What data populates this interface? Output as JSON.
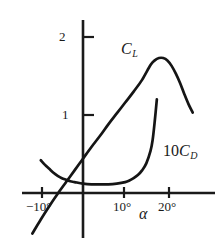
{
  "chart_data": {
    "type": "line",
    "title": "",
    "subtitle": "",
    "xlabel": "α",
    "ylabel": "",
    "xlim": [
      -13,
      31
    ],
    "ylim": [
      -0.7,
      2.25
    ],
    "grid": false,
    "legend": "inline-curve-labels",
    "x_ticks": [
      -10,
      10,
      20
    ],
    "x_tick_labels": [
      "−10°",
      "10°",
      "20°"
    ],
    "y_ticks": [
      1,
      2
    ],
    "y_tick_labels": [
      "1",
      "2"
    ],
    "x_unit": "degrees",
    "series": [
      {
        "name": "C_L",
        "label_text": "C",
        "label_sub": "L",
        "x": [
          -12.0,
          -10.0,
          -8.0,
          -6.0,
          -4.0,
          -2.0,
          0.0,
          2.0,
          4.0,
          6.0,
          8.0,
          10.0,
          12.0,
          14.0,
          16.0,
          17.0,
          18.0,
          19.0,
          20.0,
          21.0,
          22.0,
          23.0,
          24.0,
          25.0,
          26.0
        ],
        "y": [
          -0.52,
          -0.34,
          -0.17,
          -0.01,
          0.14,
          0.29,
          0.44,
          0.59,
          0.73,
          0.88,
          1.02,
          1.16,
          1.3,
          1.45,
          1.64,
          1.7,
          1.73,
          1.73,
          1.7,
          1.63,
          1.53,
          1.41,
          1.27,
          1.14,
          1.03
        ]
      },
      {
        "name": "10C_D",
        "label_text": "C",
        "label_sub": "D",
        "label_prefix": "10",
        "x": [
          -10.0,
          -9.0,
          -8.0,
          -7.0,
          -6.0,
          -5.0,
          -4.0,
          -3.0,
          -2.0,
          0.0,
          2.0,
          4.0,
          6.0,
          8.0,
          10.0,
          11.0,
          12.0,
          13.0,
          14.0,
          15.0,
          16.0,
          16.5,
          17.0,
          17.5
        ],
        "y": [
          0.42,
          0.36,
          0.31,
          0.26,
          0.22,
          0.19,
          0.17,
          0.15,
          0.14,
          0.12,
          0.11,
          0.11,
          0.11,
          0.12,
          0.14,
          0.16,
          0.19,
          0.23,
          0.29,
          0.38,
          0.54,
          0.68,
          0.92,
          1.2
        ]
      }
    ],
    "colors": {
      "curve": "#151515",
      "axis": "#1a1a1a",
      "background": "#ffffff"
    }
  },
  "labels": {
    "y_tick_2": "2",
    "y_tick_1": "1",
    "x_tick_neg10": "−10°",
    "x_tick_10": "10°",
    "x_tick_20": "20°",
    "alpha": "α",
    "cl_main": "C",
    "cl_sub": "L",
    "cd_prefix": "10",
    "cd_main": "C",
    "cd_sub": "D"
  }
}
